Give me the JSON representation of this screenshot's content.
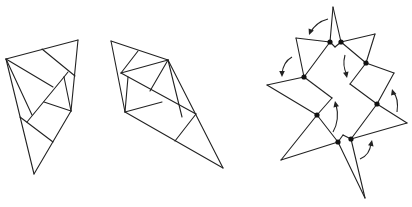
{
  "diagram": {
    "width": 412,
    "height": 207,
    "colors": {
      "stroke": "#222222",
      "hinge": "#111111",
      "background": "#ffffff"
    },
    "figures": [
      {
        "name": "dissection-triangle-1",
        "segments": [
          [
            [
              6,
              59
            ],
            [
              78,
              40
            ]
          ],
          [
            [
              78,
              40
            ],
            [
              71,
              111
            ]
          ],
          [
            [
              6,
              59
            ],
            [
              34,
              174
            ]
          ],
          [
            [
              71,
              111
            ],
            [
              34,
              174
            ]
          ],
          [
            [
              42,
              49
            ],
            [
              75,
              76
            ]
          ],
          [
            [
              6,
              59
            ],
            [
              53,
              87
            ]
          ],
          [
            [
              6,
              59
            ],
            [
              32,
              115
            ]
          ],
          [
            [
              64,
              77
            ],
            [
              27,
              122
            ]
          ],
          [
            [
              64,
              77
            ],
            [
              71,
              111
            ]
          ],
          [
            [
              68,
              72
            ],
            [
              64,
              77
            ]
          ],
          [
            [
              44,
              102
            ],
            [
              71,
              111
            ]
          ],
          [
            [
              20,
              117
            ],
            [
              53,
              142
            ]
          ]
        ],
        "hinges": []
      },
      {
        "name": "dissection-triangle-2",
        "segments": [
          [
            [
              111,
              41
            ],
            [
              168,
              60
            ]
          ],
          [
            [
              111,
              41
            ],
            [
              125,
              112
            ]
          ],
          [
            [
              168,
              60
            ],
            [
              223,
              168
            ]
          ],
          [
            [
              125,
              112
            ],
            [
              223,
              168
            ]
          ],
          [
            [
              138,
              51
            ],
            [
              121,
              73
            ]
          ],
          [
            [
              121,
              73
            ],
            [
              168,
              60
            ]
          ],
          [
            [
              121,
              73
            ],
            [
              196,
              114
            ]
          ],
          [
            [
              128,
              77
            ],
            [
              125,
              112
            ]
          ],
          [
            [
              168,
              60
            ],
            [
              150,
              91
            ]
          ],
          [
            [
              125,
              112
            ],
            [
              162,
              102
            ]
          ],
          [
            [
              168,
              60
            ],
            [
              182,
              117
            ]
          ],
          [
            [
              196,
              114
            ],
            [
              175,
              141
            ]
          ]
        ],
        "hinges": []
      },
      {
        "name": "hinged-dissection-unfolded",
        "segments": [
          [
            [
              330,
              42
            ],
            [
              333,
              7
            ]
          ],
          [
            [
              333,
              7
            ],
            [
              341,
              42
            ]
          ],
          [
            [
              330,
              42
            ],
            [
              335,
              47
            ]
          ],
          [
            [
              335,
              47
            ],
            [
              341,
              42
            ]
          ],
          [
            [
              330,
              42
            ],
            [
              296,
              38
            ]
          ],
          [
            [
              296,
              38
            ],
            [
              304,
              77
            ]
          ],
          [
            [
              330,
              42
            ],
            [
              304,
              77
            ]
          ],
          [
            [
              304,
              77
            ],
            [
              267,
              85
            ]
          ],
          [
            [
              267,
              85
            ],
            [
              317,
              115
            ]
          ],
          [
            [
              304,
              77
            ],
            [
              332,
              98
            ]
          ],
          [
            [
              332,
              98
            ],
            [
              317,
              115
            ]
          ],
          [
            [
              317,
              115
            ],
            [
              281,
              160
            ]
          ],
          [
            [
              281,
              160
            ],
            [
              338,
              142
            ]
          ],
          [
            [
              317,
              115
            ],
            [
              338,
              142
            ]
          ],
          [
            [
              338,
              142
            ],
            [
              343,
              135
            ]
          ],
          [
            [
              343,
              135
            ],
            [
              351,
              139
            ]
          ],
          [
            [
              338,
              142
            ],
            [
              365,
              198
            ]
          ],
          [
            [
              365,
              198
            ],
            [
              351,
              139
            ]
          ],
          [
            [
              351,
              139
            ],
            [
              407,
              123
            ]
          ],
          [
            [
              407,
              123
            ],
            [
              377,
              104
            ]
          ],
          [
            [
              377,
              104
            ],
            [
              351,
              139
            ]
          ],
          [
            [
              377,
              104
            ],
            [
              350,
              84
            ]
          ],
          [
            [
              350,
              84
            ],
            [
              366,
              63
            ]
          ],
          [
            [
              377,
              104
            ],
            [
              394,
              73
            ]
          ],
          [
            [
              394,
              73
            ],
            [
              366,
              63
            ]
          ],
          [
            [
              366,
              63
            ],
            [
              375,
              34
            ]
          ],
          [
            [
              375,
              34
            ],
            [
              341,
              42
            ]
          ],
          [
            [
              341,
              42
            ],
            [
              366,
              63
            ]
          ]
        ],
        "hinges": [
          [
            330,
            42
          ],
          [
            341,
            42
          ],
          [
            304,
            77
          ],
          [
            366,
            63
          ],
          [
            317,
            115
          ],
          [
            377,
            104
          ],
          [
            338,
            142
          ],
          [
            351,
            139
          ]
        ],
        "arrows": [
          {
            "name": "rotate-arrow-top",
            "path": "M328,19 Q316,22 310,33",
            "head": [
              309,
              35
            ],
            "dir": [
              -0.4,
              1
            ]
          },
          {
            "name": "rotate-arrow-left",
            "path": "M292,57 Q283,62 282,74",
            "head": [
              282,
              77
            ],
            "dir": [
              0,
              1
            ]
          },
          {
            "name": "rotate-arrow-inner-right",
            "path": "M345,55 Q342,66 347,75",
            "head": [
              347,
              78
            ],
            "dir": [
              0.2,
              1
            ]
          },
          {
            "name": "rotate-arrow-inner-left",
            "path": "M333,132 Q340,120 336,104",
            "head": [
              335,
              101
            ],
            "dir": [
              -0.2,
              -1
            ]
          },
          {
            "name": "rotate-arrow-right",
            "path": "M397,112 Q399,98 393,92",
            "head": [
              392,
              89
            ],
            "dir": [
              -0.3,
              -1
            ]
          },
          {
            "name": "rotate-arrow-bottom",
            "path": "M360,159 Q370,155 371,143",
            "head": [
              372,
              140
            ],
            "dir": [
              0.2,
              -1
            ]
          }
        ]
      }
    ]
  }
}
